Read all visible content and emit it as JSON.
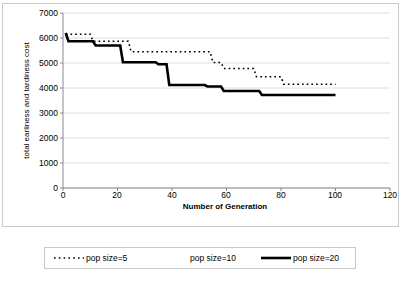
{
  "chart_data": {
    "type": "line",
    "title": "",
    "xlabel": "Number of Generation",
    "ylabel": "total earliness and tardiness cost",
    "xlim": [
      0,
      120
    ],
    "ylim": [
      0,
      7000
    ],
    "xticks": [
      0,
      20,
      40,
      60,
      80,
      100,
      120
    ],
    "yticks": [
      0,
      1000,
      2000,
      3000,
      4000,
      5000,
      6000,
      7000
    ],
    "grid": "horizontal",
    "legend_position": "bottom",
    "series": [
      {
        "name": "pop size=5",
        "style": "dotted",
        "color": "#000000",
        "points": [
          [
            1,
            6150
          ],
          [
            10,
            6150
          ],
          [
            11,
            5870
          ],
          [
            24,
            5870
          ],
          [
            25,
            5450
          ],
          [
            54,
            5450
          ],
          [
            55,
            5020
          ],
          [
            58,
            5020
          ],
          [
            59,
            4780
          ],
          [
            70,
            4780
          ],
          [
            71,
            4450
          ],
          [
            80,
            4450
          ],
          [
            81,
            4150
          ],
          [
            100,
            4150
          ]
        ]
      },
      {
        "name": "pop size=10",
        "style": "blank",
        "color": "#ffffff",
        "points": []
      },
      {
        "name": "pop size=20",
        "style": "solid-thick",
        "color": "#000000",
        "points": [
          [
            1,
            6200
          ],
          [
            2,
            5870
          ],
          [
            11,
            5870
          ],
          [
            12,
            5700
          ],
          [
            21,
            5700
          ],
          [
            22,
            5030
          ],
          [
            34,
            5030
          ],
          [
            35,
            4950
          ],
          [
            38,
            4950
          ],
          [
            39,
            4120
          ],
          [
            52,
            4120
          ],
          [
            53,
            4060
          ],
          [
            58,
            4060
          ],
          [
            59,
            3880
          ],
          [
            72,
            3880
          ],
          [
            73,
            3720
          ],
          [
            100,
            3720
          ]
        ]
      }
    ]
  },
  "axis": {
    "y_tick_labels": [
      "7000",
      "6000",
      "5000",
      "4000",
      "3000",
      "2000",
      "1000",
      "0"
    ],
    "x_tick_labels": [
      "0",
      "20",
      "40",
      "60",
      "80",
      "100",
      "120"
    ]
  },
  "legend": {
    "entries": [
      {
        "label": "pop size=5",
        "style": "dotted"
      },
      {
        "label": "pop size=10",
        "style": "blank"
      },
      {
        "label": "pop size=20",
        "style": "solid-thick"
      }
    ]
  }
}
